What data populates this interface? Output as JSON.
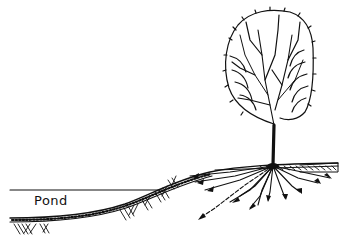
{
  "illustration": {
    "subject": "tree beside pond with roots extending toward water",
    "labels": {
      "pond": "Pond"
    },
    "colors": {
      "ink": "#111111",
      "background": "#ffffff"
    }
  }
}
